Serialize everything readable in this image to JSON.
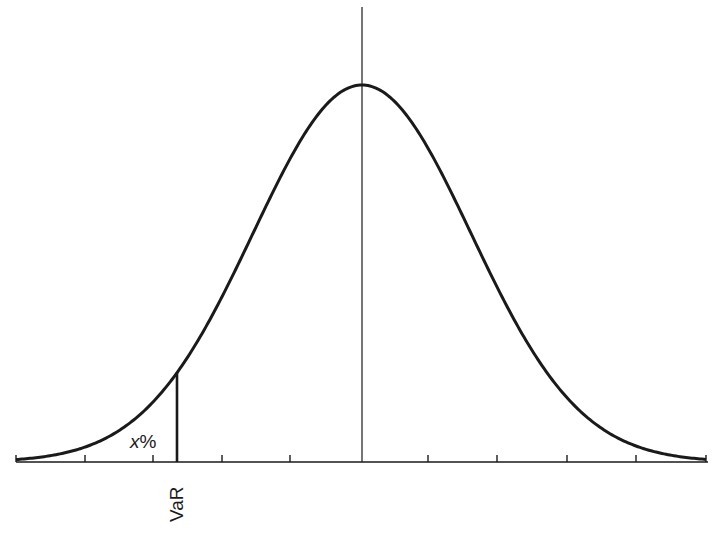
{
  "chart_data": {
    "type": "line",
    "title": "",
    "distribution": {
      "mean_px": 362,
      "sigma_px": 109,
      "peak_y_px": 85,
      "axis_y_px": 462
    },
    "x_range_px": [
      16,
      706
    ],
    "tick_positions_px": [
      16,
      85,
      153,
      222,
      290,
      428,
      497,
      567,
      636,
      706
    ],
    "center_line_x_px": 362,
    "var_line_x_px": 177,
    "grid": false,
    "legend": null
  },
  "annotations": {
    "tail_label_var": "x",
    "tail_label_suffix": "%",
    "var_label": "VaR"
  },
  "colors": {
    "line": "#1a1a1a",
    "background": "#ffffff"
  }
}
